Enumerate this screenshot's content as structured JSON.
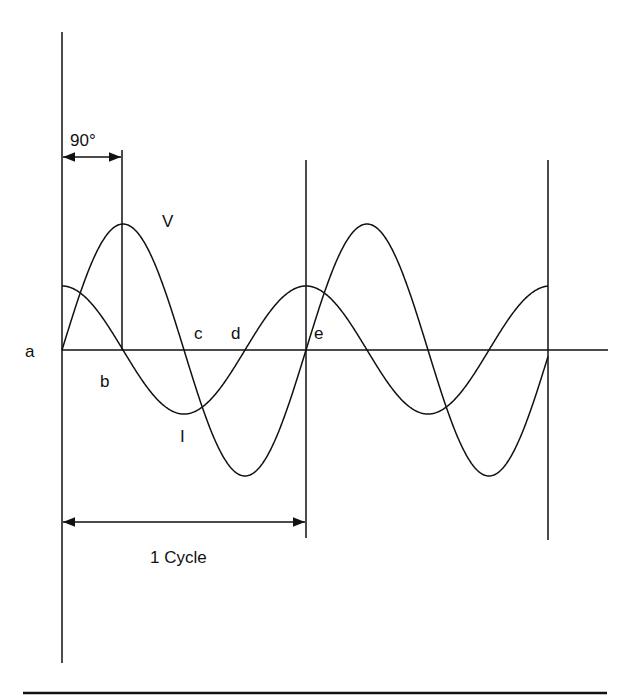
{
  "diagram": {
    "title": "",
    "labels": {
      "phase": "90°",
      "voltage": "V",
      "current": "I",
      "a": "a",
      "b": "b",
      "c": "c",
      "d": "d",
      "e": "e",
      "cycle": "1 Cycle"
    },
    "waves": [
      {
        "name": "V",
        "type": "sine",
        "amplitude": 126,
        "period_px": 244
      },
      {
        "name": "I",
        "type": "cosine",
        "amplitude": 64,
        "period_px": 244
      }
    ],
    "colors": {
      "stroke": "#111111",
      "background": "#ffffff"
    }
  }
}
